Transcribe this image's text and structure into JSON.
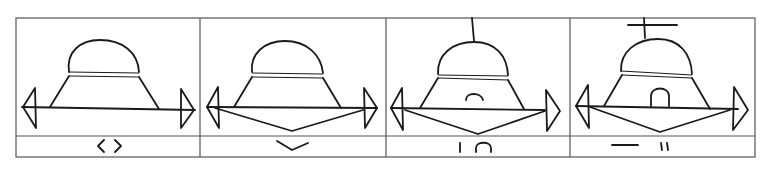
{
  "diagram": {
    "type": "hand-drawn panel sequence",
    "colors": {
      "ink": "#1a1a1a",
      "frame": "#555555",
      "background": "#ffffff"
    },
    "panels": [
      {
        "index": 1,
        "description": "dome with band, trapezoid body, horizontal double-headed arrow",
        "features": {
          "top_mark": "none",
          "lower_v": false,
          "inner_arch": "none"
        },
        "caption_symbols": "〈 〉",
        "caption_description": "pair of angle brackets"
      },
      {
        "index": 2,
        "description": "same figure with V-shaped line below the base arrow",
        "features": {
          "top_mark": "none",
          "lower_v": true,
          "inner_arch": "none"
        },
        "caption_symbols": "⌄",
        "caption_description": "downward V / check shape"
      },
      {
        "index": 3,
        "description": "figure with vertical line on top of dome, V below, open arch inside body",
        "features": {
          "top_mark": "vertical-line",
          "lower_v": true,
          "inner_arch": "open-arch"
        },
        "caption_symbols": "| ∩",
        "caption_description": "vertical bar and arch"
      },
      {
        "index": 4,
        "description": "figure with cross on top of dome, V below, closed arch (doorway) inside body",
        "features": {
          "top_mark": "cross",
          "lower_v": true,
          "inner_arch": "closed-arch"
        },
        "caption_symbols": "— ॥",
        "caption_description": "horizontal dash and double vertical strokes"
      }
    ]
  }
}
